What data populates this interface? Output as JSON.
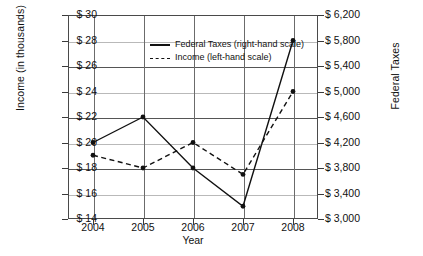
{
  "chart_data": {
    "type": "line",
    "title": "",
    "xlabel": "Year",
    "ylabel": "Income (in thousands)",
    "y2label": "Federal Taxes",
    "categories": [
      "2004",
      "2005",
      "2006",
      "2007",
      "2008"
    ],
    "x": [
      2004,
      2005,
      2006,
      2007,
      2008
    ],
    "grid": true,
    "legend_position": "inside-top-center",
    "ylim": [
      14,
      30
    ],
    "ytick_step": 2,
    "ytick_labels": [
      "$ 14",
      "$ 16",
      "$ 18",
      "$ 20",
      "$ 22",
      "$ 24",
      "$ 26",
      "$ 28",
      "$ 30"
    ],
    "ytick_values": [
      14,
      16,
      18,
      20,
      22,
      24,
      26,
      28,
      30
    ],
    "y2lim": [
      3000,
      6200
    ],
    "y2tick_step": 400,
    "y2tick_labels": [
      "$ 3,000",
      "$ 3,400",
      "$ 3,800",
      "$ 4,200",
      "$ 4,600",
      "$ 5,000",
      "$ 5,400",
      "$ 5,800",
      "$ 6,200"
    ],
    "y2tick_values": [
      3000,
      3400,
      3800,
      4200,
      4600,
      5000,
      5400,
      5800,
      6200
    ],
    "xtick_labels": [
      "2004",
      "2005",
      "2006",
      "2007",
      "2008"
    ],
    "series": [
      {
        "name": "Federal Taxes (right-hand scale)",
        "axis": "right",
        "style": "solid",
        "color": "#111111",
        "values": [
          4200,
          4600,
          3800,
          3200,
          5800
        ],
        "plot_positions_left_scale": [
          20,
          22,
          18,
          15,
          28
        ]
      },
      {
        "name": "Income (left-hand scale)",
        "axis": "left",
        "style": "dashed",
        "color": "#111111",
        "values": [
          19,
          18,
          20,
          17.5,
          24
        ]
      }
    ],
    "legend_entries": [
      {
        "label": "Federal Taxes (right-hand scale)",
        "style": "solid"
      },
      {
        "label": "Income (left-hand scale)",
        "style": "dashed"
      }
    ]
  }
}
